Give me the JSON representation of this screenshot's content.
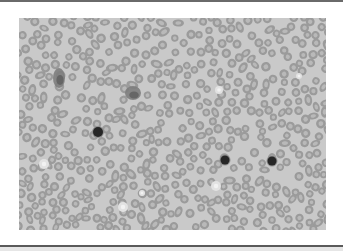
{
  "figure": {
    "caption": "Peripheral blood smear micrograph",
    "colors": {
      "background": "#c9c9c9",
      "rbc_ring": "#9b9b9b",
      "rbc_center": "#b9b9b9",
      "nucleated_cell": "#262626",
      "clump": "#7d7d7d",
      "pale_cell": "#e2e2e2"
    },
    "frame": {
      "x": 19,
      "y": 18,
      "width": 307,
      "height": 212
    }
  },
  "nucleated_cells": [
    {
      "x": 79,
      "y": 114,
      "r": 5
    },
    {
      "x": 206,
      "y": 142,
      "r": 4.5
    },
    {
      "x": 253,
      "y": 143,
      "r": 4.5
    }
  ],
  "clumps": [
    {
      "x": 40,
      "y": 60,
      "rx": 6,
      "ry": 10
    },
    {
      "x": 114,
      "y": 75,
      "rx": 8,
      "ry": 7
    }
  ],
  "pale_cells": [
    {
      "x": 25,
      "y": 146,
      "r": 5
    },
    {
      "x": 104,
      "y": 189,
      "r": 5
    },
    {
      "x": 197,
      "y": 168,
      "r": 5
    },
    {
      "x": 200,
      "y": 72,
      "r": 4
    },
    {
      "x": 280,
      "y": 58,
      "r": 3
    },
    {
      "x": 123,
      "y": 175,
      "r": 3
    }
  ]
}
